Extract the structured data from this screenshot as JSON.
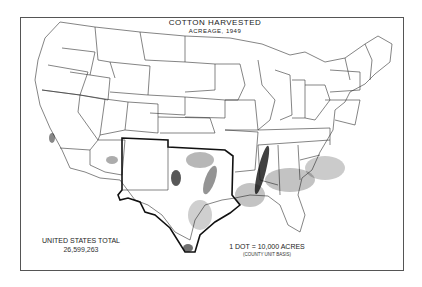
{
  "map": {
    "title": "COTTON HARVESTED",
    "subtitle": "ACREAGE, 1949",
    "total_label": "UNITED STATES TOTAL",
    "total_value": "26,599,263",
    "legend_label": "1 DOT = 10,000 ACRES",
    "legend_note": "(COUNTY UNIT BASIS)",
    "highlighted_region": "Texas, Oklahoma, New Mexico (bold outline)",
    "colors": {
      "background": "#ffffff",
      "lines": "#222222",
      "dots": "#111111",
      "frame": "#555555"
    }
  }
}
